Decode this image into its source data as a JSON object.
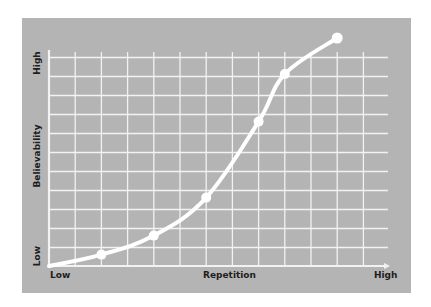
{
  "chart_data": {
    "type": "line",
    "title": "",
    "xlabel": "Repetition",
    "ylabel": "Believability",
    "x_tick_labels": {
      "low": "Low",
      "high": "High"
    },
    "y_tick_labels": {
      "low": "Low",
      "high": "High"
    },
    "grid": true,
    "legend": null,
    "xlim": [
      0,
      13
    ],
    "ylim": [
      0,
      11.5
    ],
    "series": [
      {
        "name": "Believability vs Repetition",
        "curve": "smooth S-curve",
        "x": [
          0,
          2,
          4,
          6,
          8,
          9,
          11
        ],
        "y": [
          0,
          0.6,
          1.6,
          3.6,
          7.6,
          10.1,
          12.0
        ],
        "markers_at_index": [
          1,
          2,
          3,
          4,
          5,
          6
        ]
      }
    ],
    "colors": {
      "background": "#b4b4b4",
      "grid": "#f2f2f2",
      "curve": "#ffffff",
      "text": "#1e1e1e"
    }
  },
  "labels": {
    "y_high": "High",
    "y_axis": "Believability",
    "y_low": "Low",
    "x_low": "Low",
    "x_axis": "Repetition",
    "x_high": "High"
  }
}
